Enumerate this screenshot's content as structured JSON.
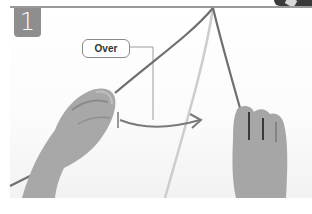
{
  "step": {
    "number": "1",
    "callout_label": "Over"
  },
  "illustration": {
    "description": "Two hands holding cords hanging from a top bar; left cord is crossed over the center cord",
    "colors": {
      "badge": "#8e8e8e",
      "bar": "#9a9a9a",
      "cord_dark": "#6e6e6e",
      "cord_light": "#c8c8c8",
      "arrow": "#7a7a7a",
      "skin": "#a9a9a9"
    }
  }
}
